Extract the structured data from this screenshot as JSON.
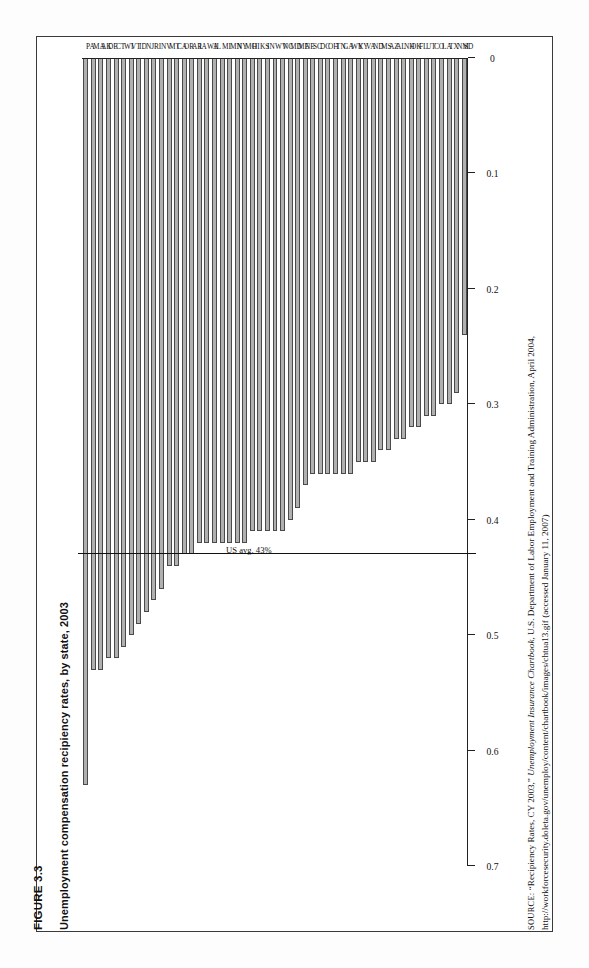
{
  "figure": {
    "number_label": "FIGURE 3.3",
    "title": "Unemployment compensation recipiency rates, by state, 2003"
  },
  "source": {
    "prefix": "SOURCE:",
    "text_part1": "“Recipiency Rates, CY 2003,” ",
    "italic_part": "Unemployment Insurance Chartbook",
    "text_part2": ", U.S. Department of Labor Employment and Training Administration, April 2004, http://workforcesecurity.doleta.gov/unemploy/content/chartbook/images/chtua13.gif (accessed January 11, 2007)"
  },
  "annotation": {
    "avg_label": "US avg. 43%",
    "avg_value": 0.43
  },
  "chart_data": {
    "type": "bar",
    "orientation": "horizontal-print-rotated",
    "title": "Unemployment compensation recipiency rates, by state, 2003",
    "xlabel": "",
    "ylabel": "",
    "ylim": [
      0,
      0.7
    ],
    "grid": false,
    "legend": "none",
    "tick_labels": [
      "0",
      "0.1",
      "0.2",
      "0.3",
      "0.4",
      "0.5",
      "0.6",
      "0.7"
    ],
    "tick_values": [
      0,
      0.1,
      0.2,
      0.3,
      0.4,
      0.5,
      0.6,
      0.7
    ],
    "categories": [
      "PA",
      "MA",
      "AK",
      "DE",
      "CT",
      "WI",
      "VT",
      "ID",
      "NJ",
      "RI",
      "NV",
      "MT",
      "CA",
      "OR",
      "AR",
      "IA",
      "WA",
      "IL",
      "MI",
      "MN",
      "NY",
      "MO",
      "HI",
      "KS",
      "IN",
      "WV",
      "NC",
      "MD",
      "ME",
      "NE",
      "SC",
      "DC",
      "OH",
      "TN",
      "GA",
      "WY",
      "KY",
      "VA",
      "ND",
      "MS",
      "AZ",
      "AL",
      "NH",
      "OK",
      "FL",
      "UT",
      "CO",
      "LA",
      "TX",
      "NM",
      "SD"
    ],
    "values": [
      0.63,
      0.53,
      0.53,
      0.52,
      0.52,
      0.51,
      0.5,
      0.49,
      0.48,
      0.47,
      0.46,
      0.44,
      0.44,
      0.43,
      0.43,
      0.42,
      0.42,
      0.42,
      0.42,
      0.42,
      0.42,
      0.42,
      0.41,
      0.41,
      0.41,
      0.41,
      0.41,
      0.4,
      0.39,
      0.37,
      0.36,
      0.36,
      0.36,
      0.36,
      0.36,
      0.36,
      0.35,
      0.35,
      0.35,
      0.34,
      0.34,
      0.33,
      0.33,
      0.32,
      0.32,
      0.31,
      0.31,
      0.3,
      0.3,
      0.29,
      0.24
    ],
    "reference_line": {
      "label": "US avg. 43%",
      "value": 0.43
    },
    "series": [
      {
        "name": "Recipiency rate",
        "values": [
          0.63,
          0.53,
          0.53,
          0.52,
          0.52,
          0.51,
          0.5,
          0.49,
          0.48,
          0.47,
          0.46,
          0.44,
          0.44,
          0.43,
          0.43,
          0.42,
          0.42,
          0.42,
          0.42,
          0.42,
          0.42,
          0.42,
          0.41,
          0.41,
          0.41,
          0.41,
          0.41,
          0.4,
          0.39,
          0.37,
          0.36,
          0.36,
          0.36,
          0.36,
          0.36,
          0.36,
          0.35,
          0.35,
          0.35,
          0.34,
          0.34,
          0.33,
          0.33,
          0.32,
          0.32,
          0.31,
          0.31,
          0.3,
          0.3,
          0.29,
          0.24
        ]
      }
    ]
  },
  "colors": {
    "bar_fill": "#b0b0b0",
    "bar_border": "#4a4a4a",
    "axis": "#222222",
    "frame": "#3a3a3a",
    "text": "#111111"
  }
}
